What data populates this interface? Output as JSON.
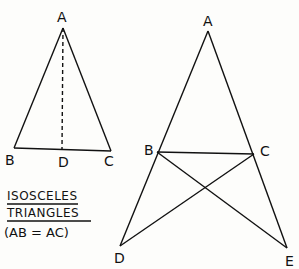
{
  "diagram": {
    "left_triangle": {
      "labels": {
        "A": "A",
        "B": "B",
        "C": "C",
        "D": "D"
      },
      "median": "AD (dashed)"
    },
    "right_figure": {
      "labels": {
        "A": "A",
        "B": "B",
        "C": "C",
        "D": "D",
        "E": "E"
      }
    },
    "caption": {
      "line1": "ISOSCELES",
      "line2": "TRIANGLES",
      "line3": "(AB = AC)"
    }
  }
}
